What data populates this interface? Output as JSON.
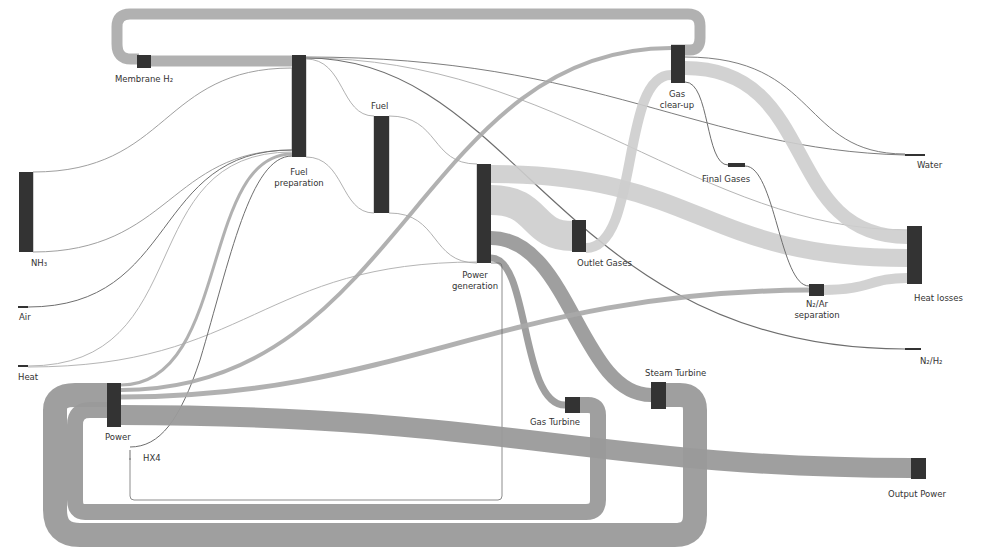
{
  "diagram": {
    "type": "sankey",
    "colors": {
      "node": "#333333",
      "flow_dark": "#9a9a9a",
      "flow_light": "#cdcdcd",
      "line": "#6e6e6e",
      "background": "#ffffff"
    },
    "nodes": [
      {
        "id": "nh3",
        "label": "NH₃"
      },
      {
        "id": "air",
        "label": "Air"
      },
      {
        "id": "heat",
        "label": "Heat"
      },
      {
        "id": "membrane_h2",
        "label": "Membrane H₂"
      },
      {
        "id": "fuel_preparation",
        "label_line1": "Fuel",
        "label_line2": "preparation"
      },
      {
        "id": "fuel",
        "label": "Fuel"
      },
      {
        "id": "power_generation",
        "label_line1": "Power",
        "label_line2": "generation"
      },
      {
        "id": "outlet_gases",
        "label": "Outlet Gases"
      },
      {
        "id": "gas_clear_up",
        "label_line1": "Gas",
        "label_line2": "clear-up"
      },
      {
        "id": "final_gases",
        "label": "Final Gases"
      },
      {
        "id": "n2_ar_separation",
        "label_line1": "N₂/Ar",
        "label_line2": "separation"
      },
      {
        "id": "water",
        "label": "Water"
      },
      {
        "id": "heat_losses",
        "label": "Heat losses"
      },
      {
        "id": "n2_h2",
        "label": "N₂/H₂"
      },
      {
        "id": "power",
        "label": "Power"
      },
      {
        "id": "hx4",
        "label": "HX4"
      },
      {
        "id": "gas_turbine",
        "label": "Gas Turbine"
      },
      {
        "id": "steam_turbine",
        "label": "Steam Turbine"
      },
      {
        "id": "output_power",
        "label": "Output Power"
      }
    ],
    "links": [
      {
        "source": "NH3",
        "target": "Fuel preparation",
        "weight": "large"
      },
      {
        "source": "Membrane H2",
        "target": "Fuel preparation",
        "weight": "medium"
      },
      {
        "source": "Gas clear-up",
        "target": "Membrane H2",
        "weight": "medium"
      },
      {
        "source": "Air",
        "target": "Fuel preparation",
        "weight": "thin"
      },
      {
        "source": "Heat",
        "target": "Fuel preparation",
        "weight": "thin"
      },
      {
        "source": "Heat",
        "target": "Power generation",
        "weight": "thin"
      },
      {
        "source": "Power",
        "target": "Fuel preparation",
        "weight": "small"
      },
      {
        "source": "HX4",
        "target": "Fuel preparation",
        "weight": "thin"
      },
      {
        "source": "Fuel preparation",
        "target": "Fuel",
        "weight": "large"
      },
      {
        "source": "Fuel preparation",
        "target": "Water",
        "weight": "thin"
      },
      {
        "source": "Fuel preparation",
        "target": "Heat losses",
        "weight": "thin"
      },
      {
        "source": "Fuel preparation",
        "target": "N2/H2",
        "weight": "thin"
      },
      {
        "source": "Fuel",
        "target": "Power generation",
        "weight": "large"
      },
      {
        "source": "Power generation",
        "target": "Outlet Gases",
        "weight": "medium"
      },
      {
        "source": "Power generation",
        "target": "Heat losses",
        "weight": "medium"
      },
      {
        "source": "Power generation",
        "target": "Gas Turbine",
        "weight": "small"
      },
      {
        "source": "Power generation",
        "target": "Steam Turbine",
        "weight": "medium"
      },
      {
        "source": "Outlet Gases",
        "target": "Gas clear-up",
        "weight": "small"
      },
      {
        "source": "Gas clear-up",
        "target": "Final Gases",
        "weight": "thin"
      },
      {
        "source": "Gas clear-up",
        "target": "Water",
        "weight": "thin"
      },
      {
        "source": "Gas clear-up",
        "target": "Heat losses",
        "weight": "medium"
      },
      {
        "source": "Final Gases",
        "target": "N2/Ar separation",
        "weight": "thin"
      },
      {
        "source": "N2/Ar separation",
        "target": "Heat losses",
        "weight": "small"
      },
      {
        "source": "Power",
        "target": "N2/Ar separation",
        "weight": "small"
      },
      {
        "source": "Power",
        "target": "Gas clear-up",
        "weight": "small"
      },
      {
        "source": "Power",
        "target": "Output Power",
        "weight": "medium"
      },
      {
        "source": "Gas Turbine",
        "target": "Power",
        "weight": "medium"
      },
      {
        "source": "Steam Turbine",
        "target": "Power",
        "weight": "medium"
      }
    ]
  }
}
